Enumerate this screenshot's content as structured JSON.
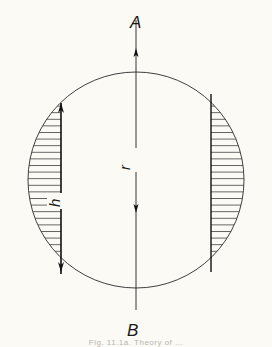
{
  "figure": {
    "labels": {
      "top_point": "A",
      "bottom_point": "B",
      "radius": "r",
      "height": "h"
    },
    "caption": "Fig. 11.1a. Theory of ...",
    "colors": {
      "background": "#fbfaf5",
      "line": "#1a1a1a",
      "hatch": "#3a3a3a",
      "caption": "#b8b6ae"
    },
    "geometry": {
      "circle_center": [
        136,
        180
      ],
      "circle_radius": 108,
      "axis_x": 136,
      "left_chord_x": 61,
      "right_chord_x": 211,
      "hatch_spacing": 6.5
    }
  }
}
